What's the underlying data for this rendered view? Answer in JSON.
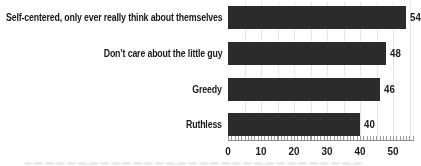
{
  "chart_data": {
    "type": "bar",
    "orientation": "horizontal",
    "title": "",
    "categories": [
      "Self-centered, only ever really think about themselves",
      "Don’t care about the little guy",
      "Greedy",
      "Ruthless"
    ],
    "values": [
      54,
      48,
      46,
      40
    ],
    "value_labels": [
      "54",
      "48",
      "46",
      "40"
    ],
    "xlim": [
      0,
      56
    ],
    "x_ticks": [
      0,
      10,
      20,
      30,
      40,
      50
    ],
    "grid_interval": 5,
    "grid_on": true,
    "legend": "none",
    "bar_color": "#2b2b2b",
    "label_color": "#1a1a1a",
    "gridline_color": "#e7e7e7",
    "axis_line_color": "#8a8a8a"
  }
}
